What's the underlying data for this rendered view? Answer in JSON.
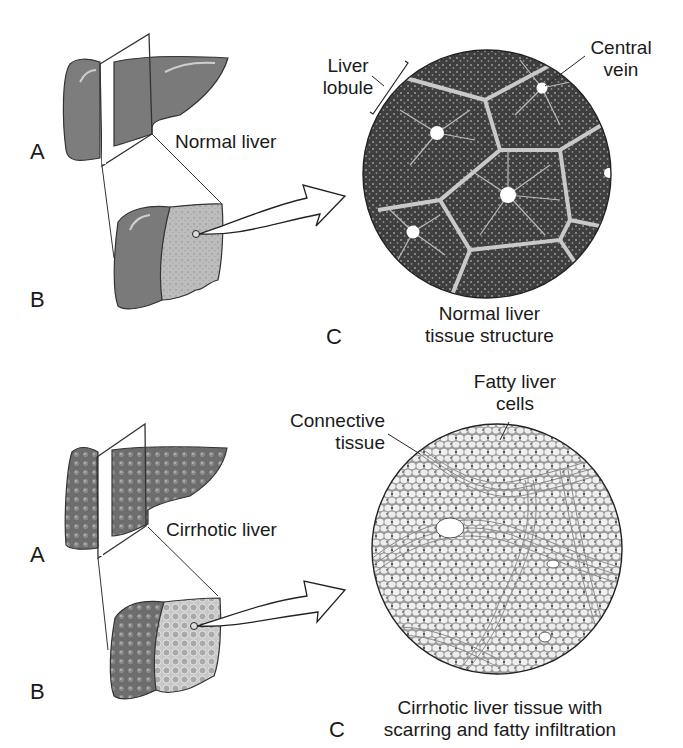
{
  "panels": [
    {
      "id": "normal",
      "liver_label": "Normal liver",
      "letter_a": "A",
      "letter_b": "B",
      "letter_c": "C",
      "tissue_caption_line1": "Normal liver",
      "tissue_caption_line2": "tissue structure",
      "annotations": {
        "lobule_line1": "Liver",
        "lobule_line2": "lobule",
        "vein_line1": "Central",
        "vein_line2": "vein"
      }
    },
    {
      "id": "cirrhotic",
      "liver_label": "Cirrhotic liver",
      "letter_a": "A",
      "letter_b": "B",
      "letter_c": "C",
      "tissue_caption_line1": "Cirrhotic liver tissue with",
      "tissue_caption_line2": "scarring and fatty infiltration",
      "annotations": {
        "connective_line1": "Connective",
        "connective_line2": "tissue",
        "fatty_line1": "Fatty liver",
        "fatty_line2": "cells"
      }
    }
  ],
  "colors": {
    "liver_fill": "#7a7a7a",
    "liver_cut": "#bdbdbd",
    "tissue_dark": "#4a4a4a",
    "tissue_light": "#e6e6e6",
    "outline": "#222222"
  }
}
